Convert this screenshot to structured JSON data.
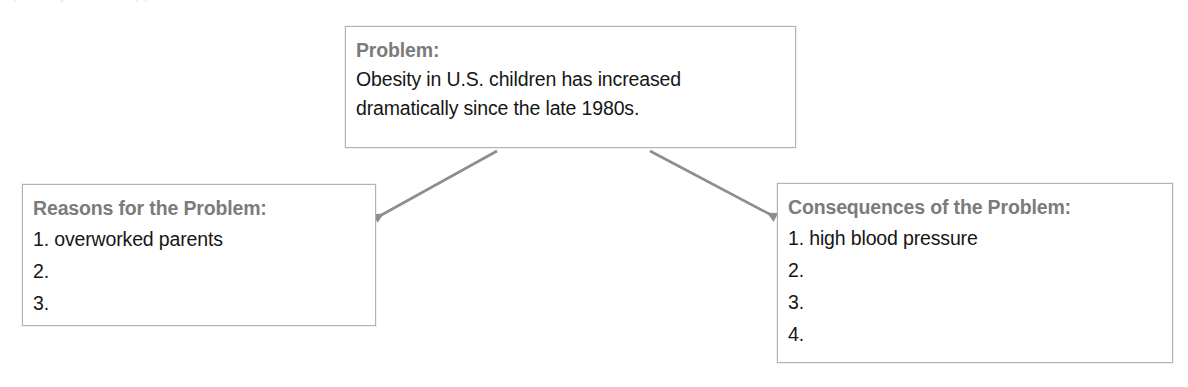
{
  "diagram": {
    "type": "problem-reasons-consequences-organizer",
    "colors": {
      "heading_text": "#7b7b7b",
      "body_text": "#161616",
      "box_border": "#b3b3b3",
      "arrow": "#8e8e8e",
      "background": "#ffffff"
    },
    "nodes": [
      {
        "id": "problem",
        "heading": "Problem:",
        "lines": [
          "Obesity in U.S. children has increased",
          "dramatically since the late 1980s."
        ]
      },
      {
        "id": "reasons",
        "heading": "Reasons for the Problem:",
        "lines": [
          "1. overworked parents",
          "2.",
          "3."
        ]
      },
      {
        "id": "consequences",
        "heading": "Consequences of the Problem:",
        "lines": [
          "1. high blood pressure",
          "2.",
          "3.",
          "4."
        ]
      }
    ],
    "arrows": [
      {
        "id": "problem-to-reasons",
        "from": "problem",
        "to": "reasons",
        "direction": "down-left"
      },
      {
        "id": "problem-to-consequences",
        "from": "problem",
        "to": "consequences",
        "direction": "down-right"
      }
    ]
  },
  "artifacts": {
    "top_clipped_text": "a partially visible clipped line of text"
  }
}
